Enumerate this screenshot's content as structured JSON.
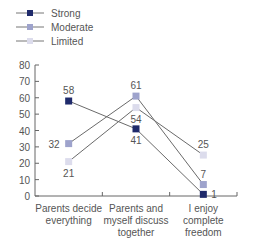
{
  "chart_data": {
    "type": "line",
    "title": "",
    "xlabel": "",
    "ylabel": "",
    "ylim": [
      0,
      80
    ],
    "yticks": [
      0,
      10,
      20,
      30,
      40,
      50,
      60,
      70,
      80
    ],
    "categories": [
      "Parents decide everything",
      "Parents and myself discuss together",
      "I enjoy complete freedom"
    ],
    "category_lines": [
      [
        "Parents decide",
        "everything"
      ],
      [
        "Parents and",
        "myself discuss",
        "together"
      ],
      [
        "I enjoy",
        "complete",
        "freedom"
      ]
    ],
    "series": [
      {
        "name": "Strong",
        "values": [
          58,
          41,
          1
        ],
        "color": "#1f2a6b"
      },
      {
        "name": "Moderate",
        "values": [
          32,
          61,
          7
        ],
        "color": "#9ea3cc"
      },
      {
        "name": "Limited",
        "values": [
          21,
          54,
          25
        ],
        "color": "#dcdcec"
      }
    ],
    "legend_position": "top-left",
    "grid": false
  },
  "legend": {
    "items": [
      {
        "label": "Strong"
      },
      {
        "label": "Moderate"
      },
      {
        "label": "Limited"
      }
    ]
  }
}
